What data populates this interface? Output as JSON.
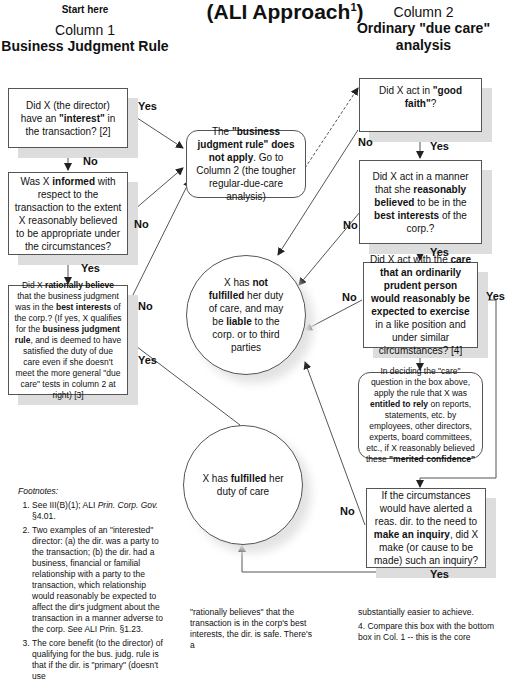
{
  "header": {
    "start_here": "Start here",
    "title": "(ALI Approach",
    "title_sup": "1",
    "title_close": ")",
    "column1_number": "Column 1",
    "column1_name": "Business Judgment Rule",
    "column2_number": "Column 2",
    "column2_name": "Ordinary \"due care\" analysis"
  },
  "column1": {
    "box1": {
      "pre": "Did X (the director) have an ",
      "bold": "\"interest\"",
      "post": " in the transaction? [2]"
    },
    "box2": {
      "pre": "Was X ",
      "bold": "informed",
      "post": " with respect to the transaction to the extent X reasonably believed to be appropriate under the circumstances?"
    },
    "box3": {
      "t1": "Did X ",
      "b1": "rationally believe",
      "t2": " that the business judgment was in the ",
      "b2": "best interests",
      "t3": " of the corp.? (If yes, X qualifies for the ",
      "b3": "business judgment rule",
      "t4": ", and is deemed to have satisfied the duty of due care even if she doesn't meet the more general \"due care\" tests in column 2 at right) [3]"
    }
  },
  "middle": {
    "bjr_box": {
      "t1": "The ",
      "b1": "\"business judgment rule\" does not apply",
      "t2": ". Go to Column 2 (the tougher regular-due-care analysis)"
    },
    "not_fulfilled": {
      "t1": "X has ",
      "b1": "not fulfilled",
      "t2": " her duty of care, and may be ",
      "b2": "liable",
      "t3": " to the corp. or to third parties"
    },
    "fulfilled": {
      "t1": "X has ",
      "b1": "fulfilled",
      "t2": " her duty of care"
    }
  },
  "column2": {
    "box1": {
      "pre": "Did X act in ",
      "bold": "\"good faith\"",
      "post": "?"
    },
    "box2": {
      "t1": "Did X act in a manner that she ",
      "b1": "reasonably believed",
      "t2": " to be in the ",
      "b2": "best interests",
      "t3": " of the corp.?"
    },
    "box3": {
      "t1": "Did X act with the ",
      "b1": "care that an ordinarily prudent person would reasonably be expected to exercise",
      "t2": " in a like position and under similar circumstances? [4]"
    },
    "reliance": {
      "t1": "In deciding the \"care\" question in the box above, apply the rule that X was ",
      "b1": "entitled to rely",
      "t2": " on reports, statements, etc. by employees, other directors, experts, board committees, etc., if X reasonably believed these ",
      "b2": "\"merited confidence\""
    },
    "box4": {
      "t1": "If the circumstances would have alerted a reas. dir. to the need to ",
      "b1": "make an inquiry",
      "t2": ", did X make (or cause to be made) such an inquiry?"
    }
  },
  "edge_labels": {
    "yes": "Yes",
    "no": "No"
  },
  "footnotes": {
    "heading": "Footnotes:",
    "items": [
      {
        "pre": "See III(B)(1); ALI ",
        "italic": "Prin. Corp. Gov.",
        "post": " §4.01."
      },
      {
        "pre": "Two examples of an \"interested\" director:  (a) the dir. was a party to the transaction; (b) the dir. had a business, financial or familial relationship with a party to the transaction, which relationship would reasonably be expected to affect the dir's judgment about the transaction in a manner adverse to the corp. See ALI Prin. §1.23.",
        "italic": "",
        "post": ""
      },
      {
        "pre": "The core benefit (to the director) of qualifying for the bus. judg. rule is that if the dir. is \"primary\" (doesn't use",
        "italic": "",
        "post": ""
      }
    ],
    "middle_text": "\"rationally believes\" that the transaction is in the corp's best interests, the dir. is safe. There's a",
    "right_text": "substantially easier to achieve.",
    "right_item4": "Compare this box with the bottom box in Col. 1 -- this is the core"
  }
}
